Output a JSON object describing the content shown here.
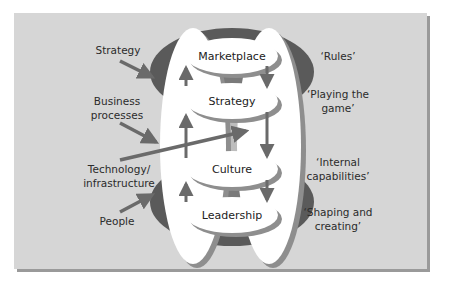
{
  "colors": {
    "panel": "#d6d6d6",
    "panel_shadow": "#9a9a9a",
    "ring": "#5a5a5a",
    "ring_inner": "#7a7a7a",
    "arrow": "#6a6a6a",
    "white": "#ffffff",
    "text": "#2b2b2b"
  },
  "left_labels": {
    "strategy": "Strategy",
    "business_line1": "Business",
    "business_line2": "processes",
    "technology_line1": "Technology/",
    "technology_line2": "infrastructure",
    "people": "People"
  },
  "discs": {
    "marketplace": "Marketplace",
    "strategy": "Strategy",
    "culture": "Culture",
    "leadership": "Leadership"
  },
  "right_labels": {
    "rules": "‘Rules’",
    "playing_line1": "‘Playing the",
    "playing_line2": "game’",
    "internal_line1": "‘Internal",
    "internal_line2": "capabilities’",
    "shaping_line1": "‘Shaping and",
    "shaping_line2": "creating’"
  }
}
